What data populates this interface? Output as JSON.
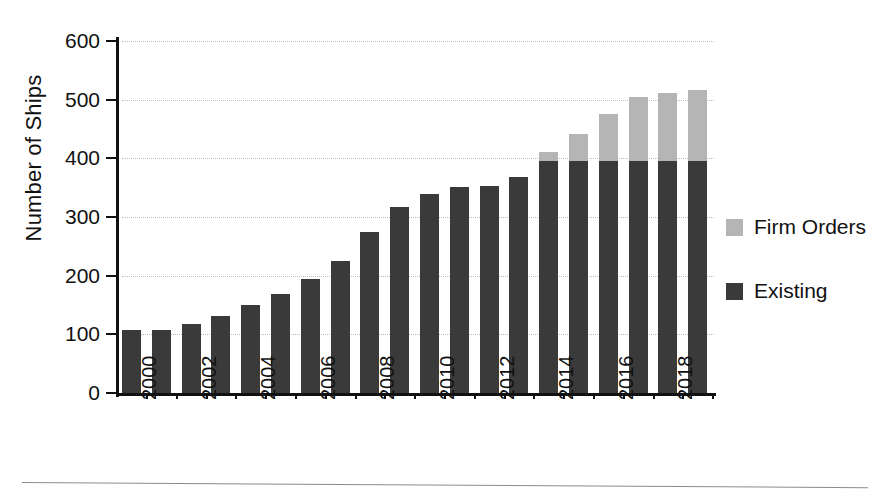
{
  "chart_data": {
    "type": "bar",
    "title": "",
    "subtitle": "",
    "xlabel": "",
    "ylabel": "Number of Ships",
    "stacked": true,
    "grid": true,
    "legend_position": "right",
    "ylim": [
      0,
      600
    ],
    "ytick_labels": [
      "600",
      "500",
      "400",
      "300",
      "200",
      "100",
      "0"
    ],
    "ytick_values": [
      600,
      500,
      400,
      300,
      200,
      100,
      0
    ],
    "categories": [
      "2000",
      "2001",
      "2002",
      "2003",
      "2004",
      "2005",
      "2006",
      "2007",
      "2008",
      "2009",
      "2010",
      "2011",
      "2012",
      "2013",
      "2014",
      "2015",
      "2016",
      "2017",
      "2018",
      "2019"
    ],
    "xtick_labels": [
      "2000",
      "2002",
      "2004",
      "2006",
      "2008",
      "2010",
      "2012",
      "2014",
      "2016",
      "2018"
    ],
    "series": [
      {
        "name": "Existing",
        "color": "#3a3a3a",
        "values": [
          107,
          108,
          117,
          131,
          150,
          168,
          194,
          225,
          275,
          317,
          339,
          351,
          353,
          369,
          396,
          396,
          396,
          396,
          396,
          396
        ]
      },
      {
        "name": "Firm Orders",
        "color": "#b5b5b5",
        "values": [
          0,
          0,
          0,
          0,
          0,
          0,
          0,
          0,
          0,
          0,
          0,
          0,
          0,
          0,
          14,
          45,
          80,
          109,
          115,
          120
        ]
      }
    ],
    "totals": [
      107,
      108,
      117,
      131,
      150,
      168,
      194,
      225,
      275,
      317,
      339,
      351,
      353,
      369,
      410,
      441,
      476,
      505,
      511,
      516
    ]
  },
  "legend": {
    "items": [
      {
        "label": "Firm Orders",
        "color": "#b5b5b5"
      },
      {
        "label": "Existing",
        "color": "#3a3a3a"
      }
    ]
  },
  "colors": {
    "existing": "#3a3a3a",
    "firm_orders": "#b5b5b5",
    "axis": "#111111",
    "grid": "#bdbdbd",
    "background": "#ffffff"
  }
}
